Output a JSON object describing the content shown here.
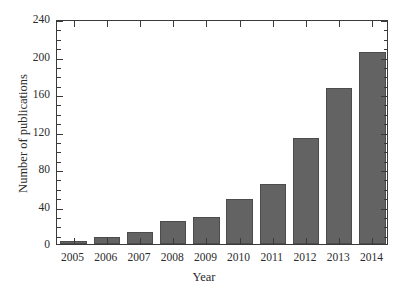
{
  "chart_data": {
    "type": "bar",
    "title": "",
    "xlabel": "Year",
    "ylabel": "Number of publications",
    "categories": [
      "2005",
      "2006",
      "2007",
      "2008",
      "2009",
      "2010",
      "2011",
      "2012",
      "2013",
      "2014"
    ],
    "values": [
      3,
      7,
      13,
      25,
      29,
      48,
      64,
      113,
      166,
      205
    ],
    "ylim": [
      0,
      240
    ],
    "yticks": [
      0,
      40,
      80,
      120,
      160,
      200,
      240
    ],
    "ytick_labels": [
      "0",
      "40",
      "80",
      "120",
      "160",
      "200",
      "240"
    ],
    "yminor_interval": 10,
    "grid": false,
    "legend": null,
    "bar_color": "#636363",
    "bar_edge_color": "#4c4c4c",
    "axis_color": "#3a3a3a",
    "background": "#ffffff"
  }
}
